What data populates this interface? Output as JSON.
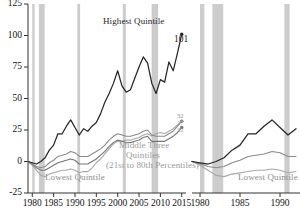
{
  "chart_data": {
    "type": "line",
    "title": "",
    "xlabel": "",
    "ylabel": "",
    "xlim": [
      1979,
      2016
    ],
    "ylim": [
      -25,
      125
    ],
    "grid": false,
    "legend_position": "inline-annotations",
    "y_ticks": [
      "125",
      "100",
      "75",
      "50",
      "25",
      "0",
      "-25"
    ],
    "y_tick_values": [
      125,
      100,
      75,
      50,
      25,
      0,
      -25
    ],
    "x_ticks": [
      "1980",
      "1985",
      "1990",
      "1995",
      "2000",
      "2005",
      "2010",
      "2015"
    ],
    "x_tick_values": [
      1980,
      1985,
      1990,
      1995,
      2000,
      2005,
      2010,
      2015
    ],
    "x": [
      1979,
      1980,
      1981,
      1982,
      1983,
      1984,
      1985,
      1986,
      1987,
      1988,
      1989,
      1990,
      1991,
      1992,
      1993,
      1994,
      1995,
      1996,
      1997,
      1998,
      1999,
      2000,
      2001,
      2002,
      2003,
      2004,
      2005,
      2006,
      2007,
      2008,
      2009,
      2010,
      2011,
      2012,
      2013,
      2014,
      2015
    ],
    "series": [
      {
        "name": "Highest Quintile",
        "color": "#262626",
        "end_value": 101,
        "end_label": "101",
        "values": [
          0,
          -1,
          -2,
          0,
          3,
          9,
          13,
          22,
          22,
          28,
          33,
          27,
          21,
          26,
          24,
          28,
          31,
          38,
          47,
          54,
          62,
          72,
          60,
          55,
          57,
          66,
          75,
          83,
          78,
          62,
          54,
          65,
          63,
          79,
          72,
          86,
          101
        ]
      },
      {
        "name": "Middle Three Quintiles",
        "sublabel": "(21st to 80th Percentiles)",
        "color": "#8a8a8a",
        "end_value": 32,
        "end_label": "32",
        "values": [
          0,
          -2,
          -4,
          -5,
          -4,
          -1,
          1,
          4,
          5,
          6,
          8,
          7,
          4,
          4,
          4,
          6,
          8,
          10,
          13,
          17,
          20,
          22,
          21,
          20,
          20,
          21,
          22,
          24,
          25,
          21,
          20,
          20,
          20,
          22,
          24,
          28,
          32
        ]
      },
      {
        "name": "Lowest Quintile",
        "color": "#a8a8a8",
        "end_value": 32,
        "end_label": "32",
        "values": [
          0,
          -3,
          -7,
          -11,
          -12,
          -10,
          -9,
          -8,
          -7,
          -7,
          -6,
          -7,
          -9,
          -8,
          -8,
          -5,
          -1,
          2,
          6,
          10,
          14,
          16,
          16,
          17,
          17,
          18,
          19,
          21,
          22,
          20,
          22,
          23,
          22,
          24,
          26,
          29,
          32
        ]
      },
      {
        "name": "Second Quintile",
        "color": "#767676",
        "end_value": 27,
        "end_label": "27",
        "values": [
          0,
          -2,
          -5,
          -7,
          -7,
          -5,
          -3,
          -1,
          0,
          1,
          2,
          1,
          -2,
          -2,
          -2,
          0,
          2,
          5,
          8,
          12,
          15,
          17,
          16,
          15,
          15,
          16,
          17,
          19,
          20,
          16,
          16,
          16,
          16,
          18,
          20,
          23,
          27
        ]
      }
    ],
    "recession_bands": [
      {
        "start": 1980.0,
        "end": 1980.55
      },
      {
        "start": 1981.55,
        "end": 1982.9
      },
      {
        "start": 1990.55,
        "end": 1991.2
      },
      {
        "start": 2001.2,
        "end": 2001.9
      },
      {
        "start": 2007.95,
        "end": 2009.45
      }
    ],
    "right_panel": {
      "x_ticks": [
        "1980",
        "1985",
        "1990"
      ],
      "x_tick_values": [
        1980,
        1985,
        1990
      ],
      "xlim": [
        1979,
        1992.5
      ],
      "ylim": [
        -25,
        125
      ],
      "note": "adjacent panel, partially cropped at right image edge",
      "series": [
        {
          "name": "Highest Quintile",
          "color": "#262626",
          "values": [
            0,
            -1,
            -2,
            0,
            3,
            9,
            13,
            22,
            22,
            28,
            33,
            27,
            21,
            26
          ]
        },
        {
          "name": "Middle Three Quintiles",
          "color": "#8a8a8a",
          "values": [
            0,
            -2,
            -4,
            -5,
            -4,
            -1,
            1,
            4,
            5,
            6,
            8,
            7,
            4,
            4
          ]
        },
        {
          "name": "Lowest Quintile",
          "color": "#a8a8a8",
          "values": [
            0,
            -3,
            -7,
            -11,
            -12,
            -10,
            -9,
            -8,
            -7,
            -7,
            -6,
            -7,
            -9,
            -8
          ]
        }
      ],
      "recession_bands": [
        {
          "start": 1980.0,
          "end": 1980.55
        },
        {
          "start": 1981.55,
          "end": 1982.9
        },
        {
          "start": 1990.55,
          "end": 1991.2
        }
      ],
      "labels": {
        "lowest_quintile": "Lowest Quintile"
      }
    },
    "annotations": {
      "highest_quintile": "Highest Quintile",
      "middle_three_line1": "Middle Three",
      "middle_three_line2": "Quintiles",
      "middle_three_line3": "(21st to 80th Percentiles)",
      "lowest_quintile": "Lowest Quintile",
      "end_101": "101",
      "end_32a": "32",
      "end_27": "27",
      "end_32b": "32"
    },
    "colors": {
      "highest": "#262626",
      "middle": "#8a8a8a",
      "second": "#767676",
      "lowest": "#a8a8a8",
      "recession_band": "#cccccc",
      "axis": "#333333",
      "background": "#ffffff"
    }
  }
}
